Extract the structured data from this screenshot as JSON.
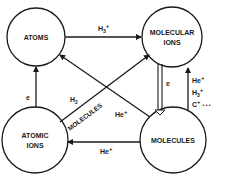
{
  "diagram": {
    "type": "reaction-network",
    "nodes": [
      {
        "id": "atoms",
        "lines": [
          "ATOMS"
        ]
      },
      {
        "id": "molecular-ions",
        "lines": [
          "MOLECULAR",
          "IONS"
        ]
      },
      {
        "id": "atomic-ions",
        "lines": [
          "ATOMIC",
          "IONS"
        ]
      },
      {
        "id": "molecules",
        "lines": [
          "MOLECULES"
        ]
      }
    ],
    "edges": [
      {
        "from": "atoms",
        "to": "molecular-ions",
        "label": "H3+"
      },
      {
        "from": "atomic-ions",
        "to": "atoms",
        "label": "e"
      },
      {
        "from": "molecular-ions",
        "to": "molecules",
        "label": "e"
      },
      {
        "from": "molecules",
        "to": "molecular-ions",
        "label": "He+ H3+ C+ ..."
      },
      {
        "from": "molecules",
        "to": "atomic-ions",
        "label": "He+"
      },
      {
        "from": "molecules",
        "to": "atoms",
        "label": "He+"
      },
      {
        "from": "atomic-ions",
        "to": "molecular-ions",
        "label": "H2 MOLECULES"
      }
    ],
    "labels": {
      "h3_base": "H",
      "sub3": "3",
      "plus": "+",
      "he": "He",
      "h2_base": "H",
      "sub2": "2",
      "e": "e",
      "c_plus_dots": "C",
      "dots": "• • •",
      "molecules_diag": "MOLECULES"
    }
  }
}
